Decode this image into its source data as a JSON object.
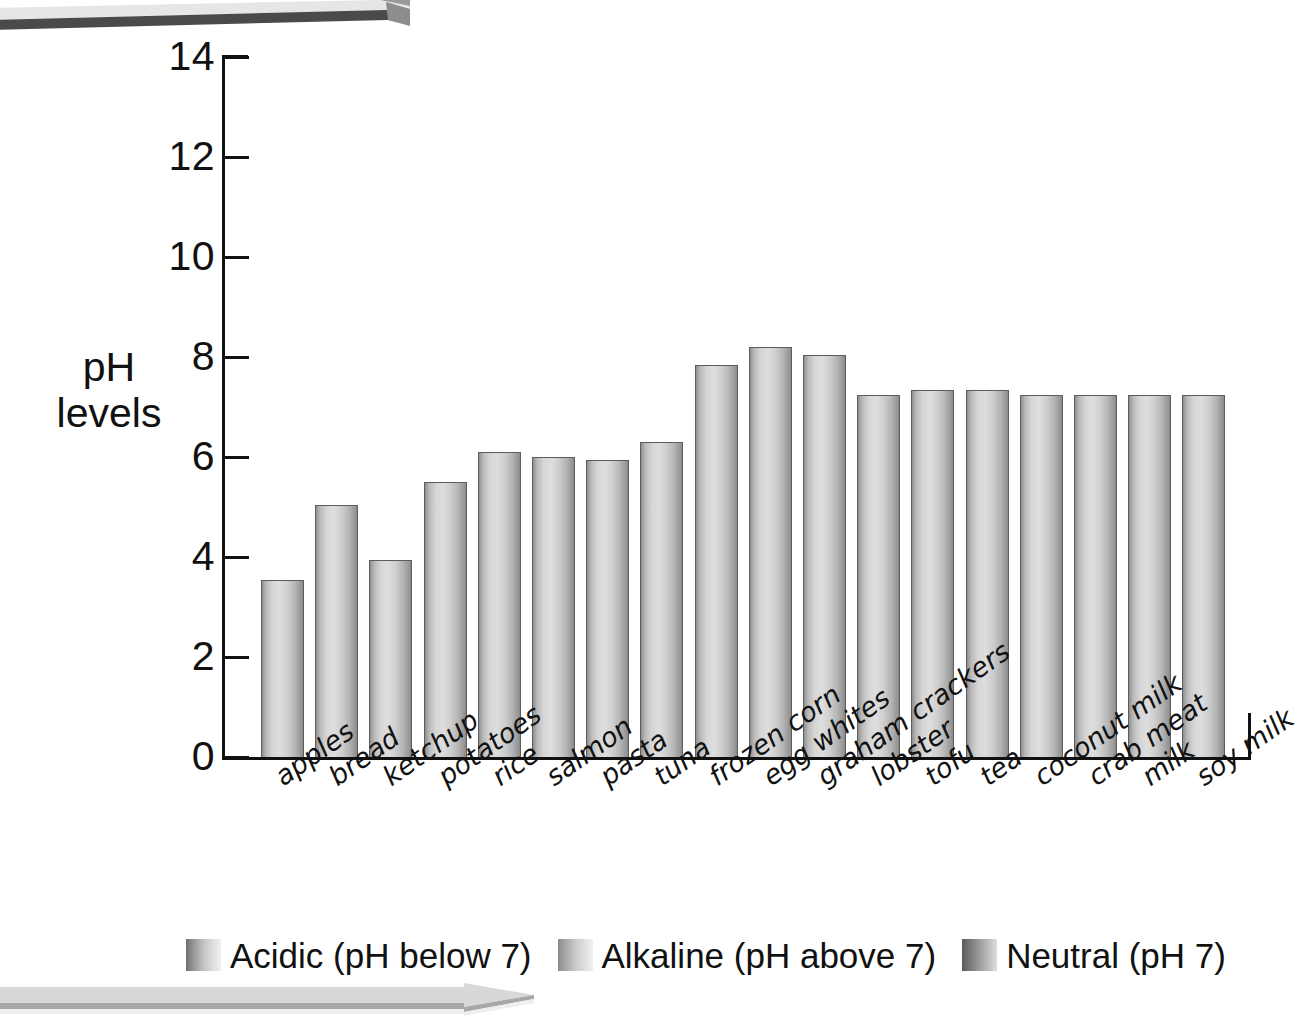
{
  "chart_data": {
    "type": "bar",
    "title": "",
    "xlabel": "",
    "ylabel": "pH levels",
    "ylim": [
      0,
      14
    ],
    "yticks": [
      0,
      2,
      4,
      6,
      8,
      10,
      12,
      14
    ],
    "grid": false,
    "legend_position": "bottom",
    "categories": [
      "apples",
      "bread",
      "ketchup",
      "potatoes",
      "rice",
      "salmon",
      "pasta",
      "tuna",
      "frozen corn",
      "egg whites",
      "graham crackers",
      "lobster",
      "tofu",
      "tea",
      "coconut milk",
      "crab meat",
      "milk",
      "soy milk"
    ],
    "values": [
      3.55,
      5.05,
      3.95,
      5.5,
      6.1,
      6.0,
      5.95,
      6.3,
      7.85,
      8.2,
      8.05,
      7.25,
      7.35,
      7.35,
      7.25,
      7.25,
      7.25,
      7.25
    ],
    "series": [
      {
        "name": "pH levels",
        "values": [
          3.55,
          5.05,
          3.95,
          5.5,
          6.1,
          6.0,
          5.95,
          6.3,
          7.85,
          8.2,
          8.05,
          7.25,
          7.35,
          7.35,
          7.25,
          7.25,
          7.25,
          7.25
        ]
      }
    ],
    "legend": [
      "Acidic (pH below 7)",
      "Alkaline (pH above 7)",
      "Neutral (pH 7)"
    ],
    "colors": {
      "bar_light": "#dedede",
      "bar_mid": "#b9b9b9",
      "bar_dark": "#8a8a8a",
      "bar_outline": "#5d5d5d",
      "axis": "#111111",
      "text": "#111111",
      "background": "#ffffff",
      "banner_top": "#7a7a7a",
      "banner_bottom": "#d2d2d2"
    }
  },
  "axis": {
    "y_title_line1": "pH",
    "y_title_line2": "levels",
    "tick_labels": [
      "14",
      "12",
      "10",
      "8",
      "6",
      "4",
      "2",
      "0"
    ]
  },
  "legend": {
    "items": [
      {
        "label": "Acidic (pH below 7)",
        "swatch": "swatch-acidic"
      },
      {
        "label": "Alkaline (pH above 7)",
        "swatch": "swatch-alkaline"
      },
      {
        "label": "Neutral (pH 7)",
        "swatch": "swatch-neutral"
      }
    ]
  },
  "decorations": {
    "top_banner": "gray-3d-arrow-banner",
    "bottom_banner": "light-gray-arrow-banner"
  }
}
